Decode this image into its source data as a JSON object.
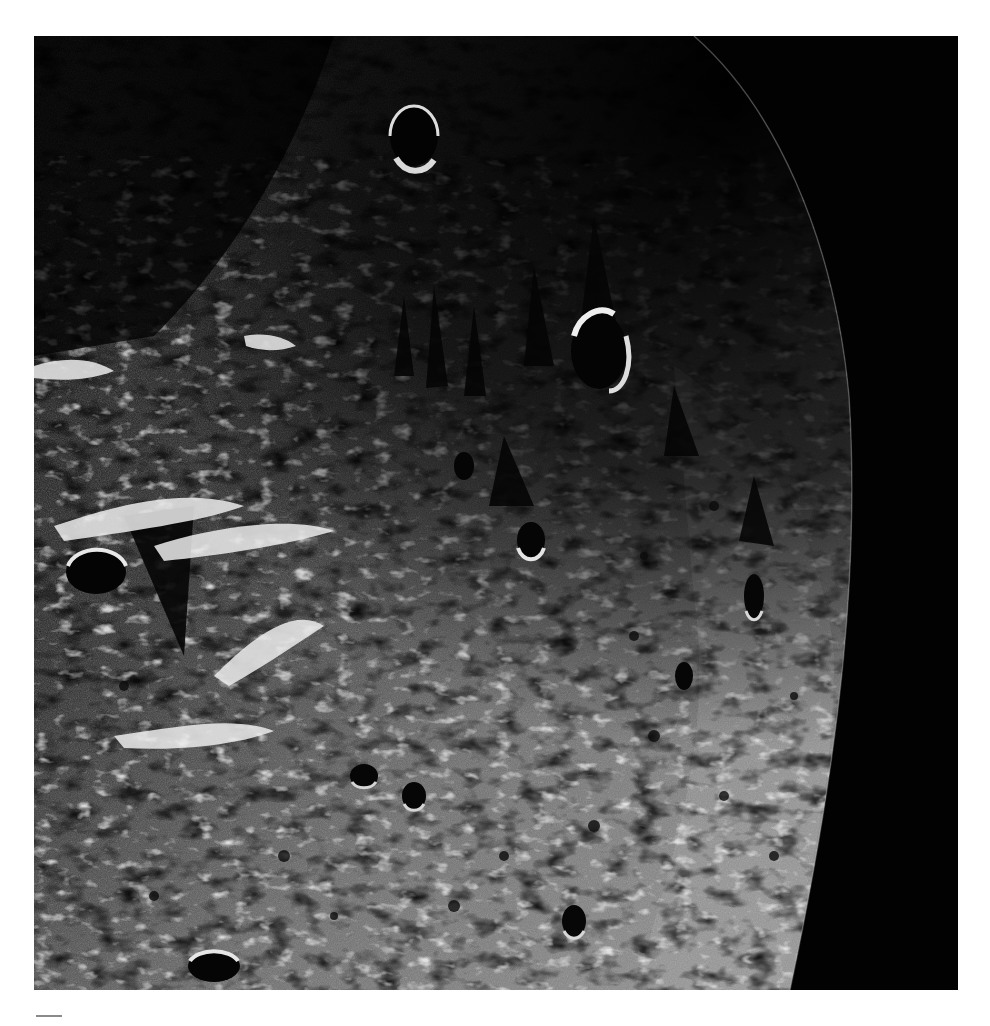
{
  "page": {
    "background_color": "#ffffff"
  },
  "photo": {
    "subject": "lunar surface near the terminator with curved limb against black space",
    "icon": "moon-surface-photo",
    "colors": {
      "space": "#020202",
      "shadow": "#0a0a0a",
      "regolith_mid": "#6e6e6e",
      "regolith_lit": "#a9a9a9",
      "highlight": "#f0f0f0"
    },
    "craters": [
      {
        "cx": 380,
        "cy": 100,
        "rx": 24,
        "ry": 30
      },
      {
        "cx": 565,
        "cy": 315,
        "rx": 28,
        "ry": 38
      },
      {
        "cx": 62,
        "cy": 536,
        "rx": 30,
        "ry": 22
      },
      {
        "cx": 497,
        "cy": 504,
        "rx": 14,
        "ry": 18
      },
      {
        "cx": 720,
        "cy": 560,
        "rx": 10,
        "ry": 22
      },
      {
        "cx": 540,
        "cy": 885,
        "rx": 12,
        "ry": 16
      },
      {
        "cx": 180,
        "cy": 930,
        "rx": 26,
        "ry": 16
      },
      {
        "cx": 430,
        "cy": 430,
        "rx": 10,
        "ry": 14
      },
      {
        "cx": 650,
        "cy": 640,
        "rx": 9,
        "ry": 14
      },
      {
        "cx": 330,
        "cy": 740,
        "rx": 14,
        "ry": 12
      },
      {
        "cx": 380,
        "cy": 760,
        "rx": 12,
        "ry": 14
      }
    ]
  },
  "caption": {
    "rule_color": "#8a8a8a"
  }
}
